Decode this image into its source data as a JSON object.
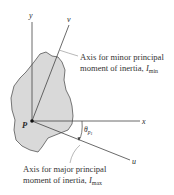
{
  "diagram": {
    "colors": {
      "region_fill": "#d9d9d9",
      "region_stroke": "#555555",
      "axis": "#444444",
      "leader": "#9a9a9a",
      "text": "#333333"
    },
    "axes": {
      "y": "y",
      "x": "x",
      "v": "v",
      "u": "u"
    },
    "point": "P",
    "angle_label": "θ",
    "angle_subscript": "p",
    "angle_subsubscript": "1",
    "annotations": {
      "minor_line1": "Axis for minor principal",
      "minor_line2": "moment of inertia, ",
      "minor_symbol": "I",
      "minor_sub": "min",
      "major_line1": "Axis for major principal",
      "major_line2": "moment of inertia, ",
      "major_symbol": "I",
      "major_sub": "max"
    }
  }
}
